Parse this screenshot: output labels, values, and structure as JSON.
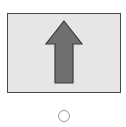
{
  "option": {
    "image": {
      "icon": "up-arrow-icon",
      "direction": "up",
      "frame_fill": "#e6e6e6",
      "frame_border": "#4a4a4a",
      "arrow_fill": "#707070",
      "arrow_stroke": "#3a3a3a"
    },
    "radio": {
      "checked": false,
      "border_color": "#9a9a9a"
    }
  }
}
